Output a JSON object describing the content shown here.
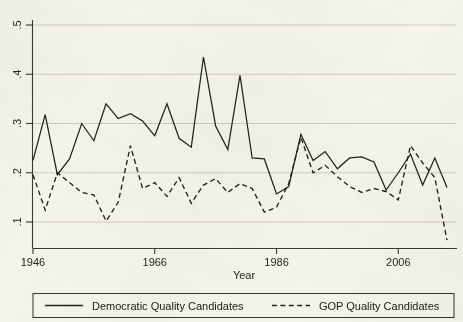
{
  "chart_data": {
    "type": "line",
    "title": "",
    "xlabel": "Year",
    "ylabel": "",
    "xlim": [
      1946,
      2014
    ],
    "ylim": [
      0.05,
      0.52
    ],
    "grid": true,
    "grid_axis": "y",
    "legend_position": "below-axis",
    "xticks": [
      1946,
      1966,
      1986,
      2006
    ],
    "xticklabels": [
      "1946",
      "1966",
      "1986",
      "2006"
    ],
    "yticks": [
      0.1,
      0.2,
      0.3,
      0.4,
      0.5
    ],
    "yticklabels": [
      ".1",
      ".2",
      ".3",
      ".4",
      ".5"
    ],
    "x": [
      1946,
      1948,
      1950,
      1952,
      1954,
      1956,
      1958,
      1960,
      1962,
      1964,
      1966,
      1968,
      1970,
      1972,
      1974,
      1976,
      1978,
      1980,
      1982,
      1984,
      1986,
      1988,
      1990,
      1992,
      1994,
      1996,
      1998,
      2000,
      2002,
      2004,
      2006,
      2008,
      2010,
      2012,
      2014
    ],
    "series": [
      {
        "name": "Democratic Quality Candidates",
        "style": "solid",
        "values": [
          0.225,
          0.318,
          0.196,
          0.228,
          0.3,
          0.265,
          0.34,
          0.31,
          0.32,
          0.305,
          0.275,
          0.34,
          0.27,
          0.252,
          0.435,
          0.295,
          0.247,
          0.398,
          0.23,
          0.228,
          0.157,
          0.172,
          0.278,
          0.225,
          0.243,
          0.208,
          0.23,
          0.232,
          0.222,
          0.165,
          0.2,
          0.238,
          0.175,
          0.23,
          0.17
        ]
      },
      {
        "name": "GOP Quality Candidates",
        "style": "dashed",
        "values": [
          0.196,
          0.124,
          0.2,
          0.18,
          0.16,
          0.155,
          0.102,
          0.14,
          0.255,
          0.168,
          0.18,
          0.152,
          0.19,
          0.138,
          0.175,
          0.188,
          0.16,
          0.178,
          0.168,
          0.12,
          0.13,
          0.178,
          0.272,
          0.2,
          0.215,
          0.192,
          0.172,
          0.16,
          0.168,
          0.162,
          0.145,
          0.255,
          0.22,
          0.19,
          0.063
        ]
      }
    ]
  },
  "legend": {
    "entries": [
      {
        "label": "Democratic Quality Candidates",
        "key": "solid-line-key"
      },
      {
        "label": "GOP Quality Candidates",
        "key": "dashed-line-key"
      }
    ]
  },
  "colors": {
    "background": "#f6f5e9",
    "ink": "#22211c",
    "grid": "#c9c8b8",
    "axis": "#3b3a33"
  }
}
